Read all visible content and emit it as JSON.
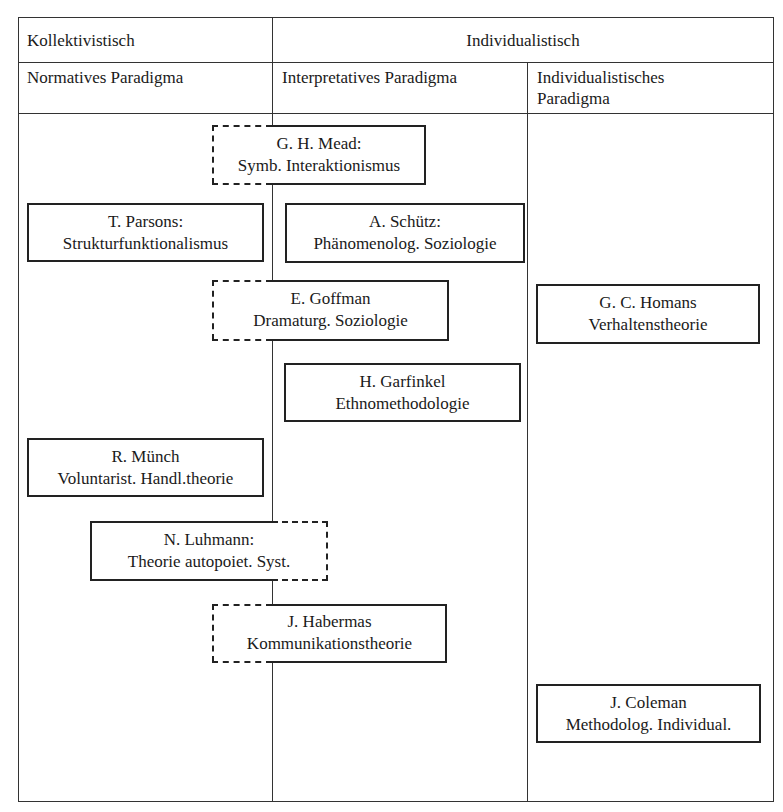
{
  "header": {
    "row1": {
      "collective": "Kollektivistisch",
      "individual": "Individualistisch"
    },
    "row2": {
      "normative": "Normatives Paradigma",
      "interpretative": "Interpretatives Paradigma",
      "individualistic_line1": "Individualistisches",
      "individualistic_line2": "Paradigma"
    }
  },
  "boxes": {
    "mead": {
      "line1": "G. H. Mead:",
      "line2": "Symb. Interaktionismus",
      "style": "dashed-left-solid-right"
    },
    "parsons": {
      "line1": "T. Parsons:",
      "line2": "Strukturfunktionalismus",
      "style": "solid"
    },
    "schuetz": {
      "line1": "A. Schütz:",
      "line2": "Phänomenolog. Soziologie",
      "style": "solid"
    },
    "goffman": {
      "line1": "E. Goffman",
      "line2": "Dramaturg. Soziologie",
      "style": "dashed-left-solid-right"
    },
    "homans": {
      "line1": "G. C. Homans",
      "line2": "Verhaltenstheorie",
      "style": "solid"
    },
    "garfinkel": {
      "line1": "H. Garfinkel",
      "line2": "Ethnomethodologie",
      "style": "solid"
    },
    "muench": {
      "line1": "R. Münch",
      "line2": "Voluntarist. Handl.theorie",
      "style": "solid"
    },
    "luhmann": {
      "line1": "N. Luhmann:",
      "line2": "Theorie autopoiet. Syst.",
      "style": "solid-left-dashed-right"
    },
    "habermas": {
      "line1": "J. Habermas",
      "line2": "Kommunikationstheorie",
      "style": "dashed-left-solid-right"
    },
    "coleman": {
      "line1": "J. Coleman",
      "line2": "Methodolog. Individual.",
      "style": "solid"
    }
  }
}
